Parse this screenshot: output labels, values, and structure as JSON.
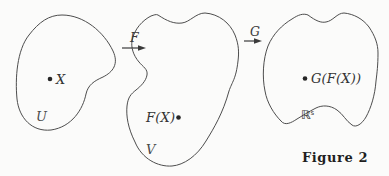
{
  "diagram": {
    "caption": "Figure 2",
    "domains": {
      "source": {
        "label": "U",
        "point": "X"
      },
      "intermediate": {
        "label": "V",
        "point": "F(X)"
      },
      "target": {
        "base": "ℝ",
        "superscript": "s",
        "point": "G(F(X))"
      }
    },
    "maps": {
      "first": "F",
      "second": "G"
    },
    "colors": {
      "background": "#fbfbfa",
      "outline": "#4d4d4d",
      "text": "#333333"
    }
  }
}
